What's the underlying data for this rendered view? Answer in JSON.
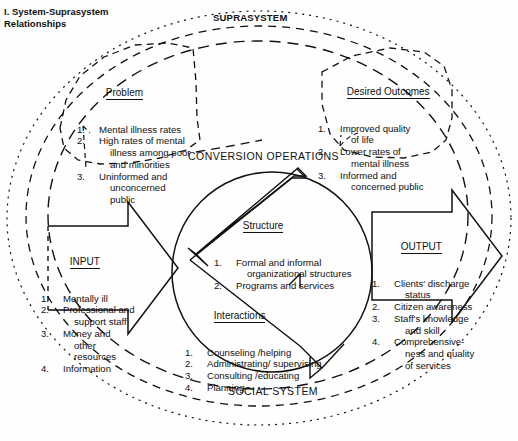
{
  "figure": {
    "title": "I. System-Suprasystem\nRelationships",
    "suprasystem_label": "SUPRASYSTEM",
    "conversion_operations_label": "CONVERSION OPERATIONS",
    "social_system_label": "SOCIAL SYSTEM",
    "line_color": "#111111",
    "background": "#fefefe"
  },
  "problem": {
    "heading": "Problem",
    "items": [
      {
        "num": "1.",
        "lines": [
          "Mental illness rates"
        ]
      },
      {
        "num": "2.",
        "lines": [
          "High rates of mental",
          "illness among poor",
          "and minorities"
        ]
      },
      {
        "num": "3.",
        "lines": [
          "Uninformed and",
          "unconcerned",
          "public"
        ]
      }
    ]
  },
  "desired_outcomes": {
    "heading": "Desired Outcomes",
    "items": [
      {
        "num": "1.",
        "lines": [
          "Improved quality",
          "of life"
        ]
      },
      {
        "num": "2.",
        "lines": [
          "Lower rates of",
          "mental illness"
        ]
      },
      {
        "num": "3.",
        "lines": [
          "Informed and",
          "concerned public"
        ]
      }
    ]
  },
  "input": {
    "heading": "INPUT",
    "items": [
      {
        "num": "1.",
        "lines": [
          "Mentally ill"
        ]
      },
      {
        "num": "2.",
        "lines": [
          "Professional and",
          "support staff"
        ]
      },
      {
        "num": "3.",
        "lines": [
          "Money and",
          "other",
          "resources"
        ]
      },
      {
        "num": "4.",
        "lines": [
          "Information"
        ]
      }
    ]
  },
  "output": {
    "heading": "OUTPUT",
    "items": [
      {
        "num": "1.",
        "lines": [
          "Clients' discharge",
          "status"
        ]
      },
      {
        "num": "2.",
        "lines": [
          "Citizen awareness"
        ]
      },
      {
        "num": "3.",
        "lines": [
          "Staff's knowledge",
          "and skill"
        ]
      },
      {
        "num": "4.",
        "lines": [
          "Comprehensive-",
          "ness and quality",
          "of services"
        ]
      }
    ]
  },
  "structure": {
    "heading": "Structure",
    "items": [
      {
        "num": "1.",
        "lines": [
          "Formal and informal",
          "organizational structures"
        ]
      },
      {
        "num": "2.",
        "lines": [
          "Programs and services"
        ]
      }
    ]
  },
  "interactions": {
    "heading": "Interactions",
    "items": [
      {
        "num": "1.",
        "lines": [
          "Counseling /helping"
        ]
      },
      {
        "num": "2.",
        "lines": [
          "Administrating/ supervising"
        ]
      },
      {
        "num": "3.",
        "lines": [
          "Consulting /educating"
        ]
      },
      {
        "num": "4.",
        "lines": [
          "Planning"
        ]
      }
    ]
  }
}
